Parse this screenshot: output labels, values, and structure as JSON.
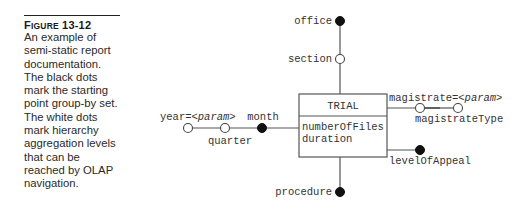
{
  "caption": {
    "label_prefix": "F",
    "label_smallcaps": "IGURE",
    "label_number": "13-12",
    "text": "An example of semi-static report documentation. The black dots mark the starting point group-by set. The white dots mark hierarchy aggregation levels that can be reached by OLAP navigation."
  },
  "diagram": {
    "fact": {
      "name": "TRIAL",
      "measures": [
        "numberOfFiles",
        "duration"
      ]
    },
    "attributes": {
      "office": {
        "label": "office",
        "dot": "black"
      },
      "section": {
        "label": "section",
        "dot": "white"
      },
      "procedure": {
        "label": "procedure",
        "dot": "black"
      },
      "month": {
        "label": "month",
        "dot": "black"
      },
      "quarter": {
        "label": "quarter",
        "dot": "white"
      },
      "year": {
        "label_prefix": "year=",
        "label_param": "<param>",
        "dot": "white"
      },
      "magistrate": {
        "label_prefix": "magistrate=",
        "label_param": "<param>",
        "dot": "white"
      },
      "magistrateType": {
        "label": "magistrateType",
        "dot": "white"
      },
      "levelOfAppeal": {
        "label": "levelOfAppeal",
        "dot": "black"
      }
    },
    "colors": {
      "black_dot": "#111111",
      "white_dot": "#ffffff",
      "line": "#555555"
    }
  }
}
